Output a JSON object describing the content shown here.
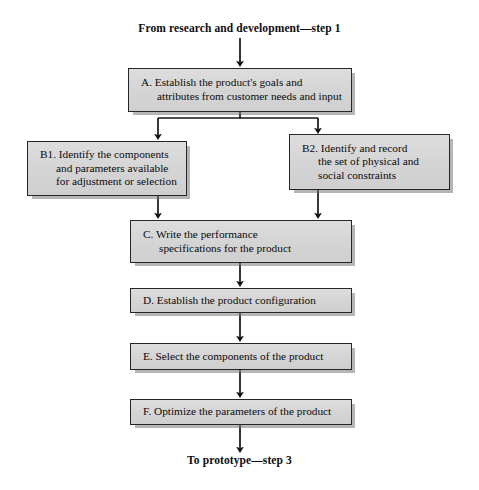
{
  "figure": {
    "type": "flowchart",
    "orientation": "top-to-bottom",
    "entry_label": "From research and development—step 1",
    "exit_label": "To prototype—step 3",
    "caption": "",
    "colors": {
      "box_fill": "#d7d7d7",
      "box_border": "#23262b",
      "shadow": "#787878",
      "text": "#0b0b0b",
      "background": "#ffffff"
    }
  },
  "nodes": [
    {
      "id": "A",
      "key": "Establish the product's goals and attributes from customer needs and input",
      "lines": [
        "A.  Establish the product's goals and",
        "attributes from customer needs and input"
      ]
    },
    {
      "id": "B1",
      "key": "Identify the components and parameters available for adjustment or selection",
      "lines": [
        "B1.  Identify the components",
        "and parameters available",
        "for adjustment or selection"
      ]
    },
    {
      "id": "B2",
      "key": "Identify and record the set of physical and social constraints",
      "lines": [
        "B2.  Identify and record",
        "the set of physical and",
        "social constraints"
      ]
    },
    {
      "id": "C",
      "key": "Write the performance specifications for the product",
      "lines": [
        "C.  Write the performance",
        "specifications for the product"
      ]
    },
    {
      "id": "D",
      "key": "Establish the product configuration",
      "lines": [
        "D.  Establish the product configuration"
      ]
    },
    {
      "id": "E",
      "key": "Select the components of the product",
      "lines": [
        "E.   Select the components of the product"
      ]
    },
    {
      "id": "F",
      "key": "Optimize the parameters of the product",
      "lines": [
        "F.   Optimize the parameters of the product"
      ]
    }
  ],
  "edges": [
    {
      "from": "entry",
      "to": "A",
      "style": "straight-arrow"
    },
    {
      "from": "A",
      "to": "B1",
      "style": "split-branch-left"
    },
    {
      "from": "A",
      "to": "B2",
      "style": "split-branch-right"
    },
    {
      "from": "B1",
      "to": "C",
      "style": "straight-arrow"
    },
    {
      "from": "B2",
      "to": "C",
      "style": "straight-arrow"
    },
    {
      "from": "C",
      "to": "D",
      "style": "straight-arrow"
    },
    {
      "from": "D",
      "to": "E",
      "style": "straight-arrow"
    },
    {
      "from": "E",
      "to": "F",
      "style": "straight-arrow"
    },
    {
      "from": "F",
      "to": "exit",
      "style": "straight-arrow"
    }
  ],
  "boxes": {
    "a": {
      "l1": "A.  Establish the product's goals and",
      "l2": "attributes from customer needs and input"
    },
    "b1": {
      "l1": "B1.  Identify the components",
      "l2": "and parameters available",
      "l3": "for adjustment or selection"
    },
    "b2": {
      "l1": "B2.  Identify and record",
      "l2": "the set of physical and",
      "l3": "social constraints"
    },
    "c": {
      "l1": "C.  Write the performance",
      "l2": "specifications for the product"
    },
    "d": {
      "l1": "D.  Establish the product configuration"
    },
    "e": {
      "l1": "E.   Select the components of the product"
    },
    "f": {
      "l1": "F.   Optimize the parameters of the product"
    }
  }
}
